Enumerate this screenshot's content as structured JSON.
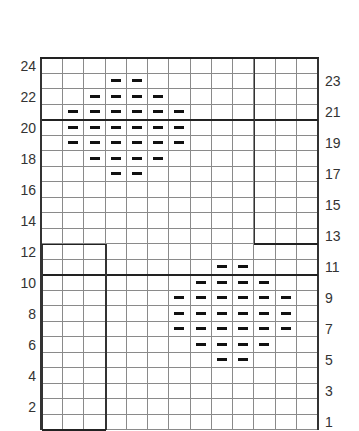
{
  "chart": {
    "type": "knitting-chart",
    "columns": 13,
    "rows": 24,
    "symbol": "purl-dash",
    "left_labels": [
      24,
      22,
      20,
      18,
      16,
      14,
      12,
      10,
      8,
      6,
      4,
      2
    ],
    "right_labels": [
      23,
      21,
      19,
      17,
      15,
      13,
      11,
      9,
      7,
      5,
      3,
      1
    ],
    "thick_row_boundaries_below": [
      21,
      11
    ],
    "boxes": [
      {
        "name": "top-right-panel",
        "cols": [
          11,
          13
        ],
        "rows": [
          13,
          24
        ]
      },
      {
        "name": "bottom-left-panel",
        "cols": [
          1,
          3
        ],
        "rows": [
          1,
          12
        ]
      }
    ],
    "motifs": [
      {
        "name": "upper-diamond",
        "rows": {
          "23": [
            4,
            5
          ],
          "22": [
            3,
            6
          ],
          "21": [
            2,
            7
          ],
          "20": [
            2,
            7
          ],
          "19": [
            2,
            7
          ],
          "18": [
            3,
            6
          ],
          "17": [
            4,
            5
          ]
        }
      },
      {
        "name": "lower-diamond",
        "rows": {
          "11": [
            9,
            10
          ],
          "10": [
            8,
            11
          ],
          "9": [
            7,
            12
          ],
          "8": [
            7,
            12
          ],
          "7": [
            7,
            12
          ],
          "6": [
            8,
            11
          ],
          "5": [
            9,
            10
          ]
        }
      }
    ]
  }
}
